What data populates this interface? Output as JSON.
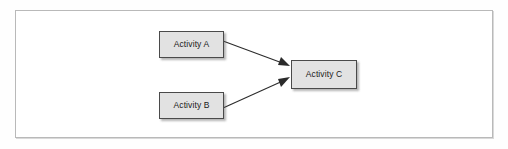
{
  "diagram": {
    "type": "activity-flow",
    "frame": {
      "name": "diagram-canvas"
    },
    "nodes": [
      {
        "id": "a",
        "label": "Activity A",
        "shape": "rectangle",
        "fill": "#e2e2e2",
        "border": "#4a4a4a"
      },
      {
        "id": "b",
        "label": "Activity B",
        "shape": "rectangle",
        "fill": "#e2e2e2",
        "border": "#4a4a4a"
      },
      {
        "id": "c",
        "label": "Activity C",
        "shape": "rectangle",
        "fill": "#e2e2e2",
        "border": "#4a4a4a"
      }
    ],
    "edges": [
      {
        "from": "a",
        "to": "c",
        "style": "solid",
        "arrow": "filled-triangle",
        "color": "#2b2b2b"
      },
      {
        "from": "b",
        "to": "c",
        "style": "solid",
        "arrow": "filled-triangle",
        "color": "#2b2b2b"
      }
    ],
    "colors": {
      "canvas_background": "#ffffff",
      "frame_border": "#b9b9b9",
      "node_fill": "#e2e2e2",
      "node_border": "#4a4a4a",
      "edge": "#2b2b2b",
      "text": "#1a1a1a"
    }
  }
}
